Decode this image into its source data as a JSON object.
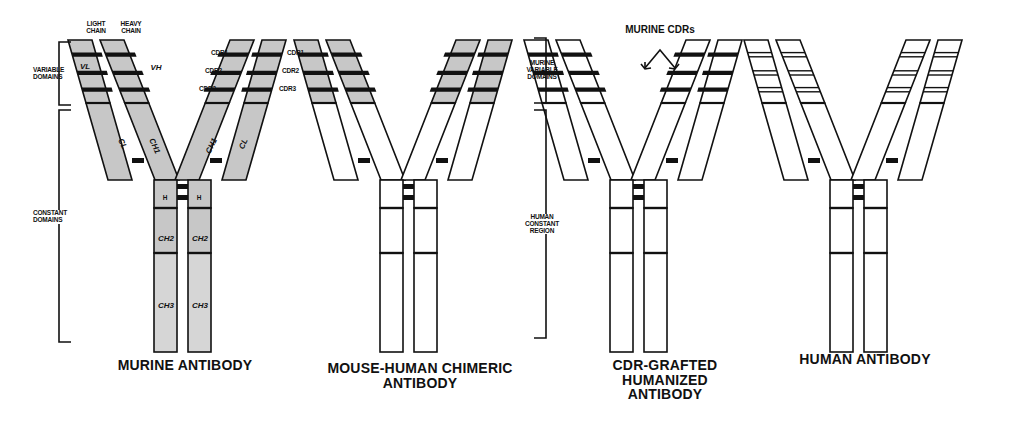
{
  "colors": {
    "murine_fill": "#c7c7c7",
    "human_fill": "#ffffff",
    "outline": "#111111",
    "cdr_band": "#111111"
  },
  "antibodies": [
    {
      "id": "murine",
      "title": "MURINE ANTIBODY",
      "title_lines": [
        "MURINE ANTIBODY"
      ],
      "variable_fill": "murine",
      "constant_fill": "murine",
      "cdr_style": "murine"
    },
    {
      "id": "chimeric",
      "title": "MOUSE-HUMAN CHIMERIC ANTIBODY",
      "title_lines": [
        "MOUSE-HUMAN CHIMERIC",
        "ANTIBODY"
      ],
      "variable_fill": "murine",
      "constant_fill": "human",
      "cdr_style": "murine"
    },
    {
      "id": "cdr-grafted",
      "title": "CDR-GRAFTED HUMANIZED ANTIBODY",
      "title_lines": [
        "CDR-GRAFTED",
        "HUMANIZED",
        "ANTIBODY"
      ],
      "variable_fill": "human",
      "constant_fill": "human",
      "cdr_style": "murine"
    },
    {
      "id": "human",
      "title": "HUMAN ANTIBODY",
      "title_lines": [
        "HUMAN ANTIBODY"
      ],
      "variable_fill": "human",
      "constant_fill": "human",
      "cdr_style": "human"
    }
  ],
  "labels": {
    "light_chain": [
      "LIGHT",
      "CHAIN"
    ],
    "heavy_chain": [
      "HEAVY",
      "CHAIN"
    ],
    "variable_domains": [
      "VARIABLE",
      "DOMAINS"
    ],
    "constant_domains": [
      "CONSTANT",
      "DOMAINS"
    ],
    "vl": "VL",
    "vh": "VH",
    "cdr1": "CDR1",
    "cdr2": "CDR2",
    "cdr3": "CDR3",
    "cl": "CL",
    "ch1": "CH1",
    "hinge": "H",
    "ch2": "CH2",
    "ch3": "CH3",
    "murine_variable_domains": [
      "MURINE",
      "VARIABLE",
      "DOMAINS"
    ],
    "human_constant_region": [
      "HUMAN",
      "CONSTANT",
      "REGION"
    ],
    "murine_cdrs": "MURINE CDRs"
  }
}
